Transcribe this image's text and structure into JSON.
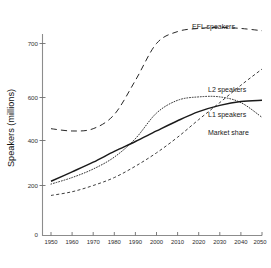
{
  "chart_data": {
    "type": "line",
    "title": "",
    "subtitle": "",
    "xlabel": "",
    "ylabel": "Speakers (millions)",
    "xlim": [
      1950,
      2050
    ],
    "ylim": [
      0,
      780
    ],
    "grid": false,
    "legend_position": "inline-right-of-curves",
    "x_ticks": [
      "1950",
      "1960",
      "1970",
      "1980",
      "1990",
      "2000",
      "2010",
      "2020",
      "2030",
      "2040",
      "2050"
    ],
    "y_ticks": [
      "0",
      "200",
      "400",
      "600",
      "700"
    ],
    "axis_break_note": "zero tick detached at axis base; 200-700 region linear",
    "x": [
      1950,
      1960,
      1970,
      1980,
      1990,
      2000,
      2010,
      2020,
      2030,
      2040,
      2050
    ],
    "series": [
      {
        "name": "EFL speakers",
        "label": "EFL speakers",
        "style": "long-dashed",
        "color": "#1a1a1a",
        "values": [
          400,
          392,
          400,
          450,
          570,
          700,
          742,
          753,
          757,
          753,
          745
        ]
      },
      {
        "name": "L2 speakers",
        "label": "L2 speakers",
        "style": "short-dashed",
        "color": "#1a1a1a",
        "values": [
          165,
          178,
          200,
          228,
          268,
          315,
          370,
          432,
          492,
          553,
          610
        ]
      },
      {
        "name": "L1 speakers",
        "label": "L1 speakers",
        "style": "solid",
        "color": "#1a1a1a",
        "values": [
          215,
          248,
          282,
          320,
          355,
          392,
          428,
          460,
          482,
          496,
          500
        ]
      },
      {
        "name": "Market share",
        "label": "Market share",
        "style": "dotted",
        "color": "#8c8c8c",
        "values": [
          205,
          228,
          258,
          300,
          365,
          455,
          500,
          512,
          512,
          492,
          440
        ]
      }
    ]
  },
  "labels": {
    "efl": "EFL speakers",
    "l2": "L2 speakers",
    "l1": "L1 speakers",
    "market_share": "Market share",
    "y_axis_title": "Speakers (millions)"
  },
  "y_tick_labels": {
    "t700": "700",
    "t600": "600",
    "t400": "400",
    "t200": "200",
    "t0": "0"
  },
  "x_tick_labels": {
    "t1950": "1950",
    "t1960": "1960",
    "t1970": "1970",
    "t1980": "1980",
    "t1990": "1990",
    "t2000": "2000",
    "t2010": "2010",
    "t2020": "2020",
    "t2030": "2030",
    "t2040": "2040",
    "t2050": "2050"
  }
}
